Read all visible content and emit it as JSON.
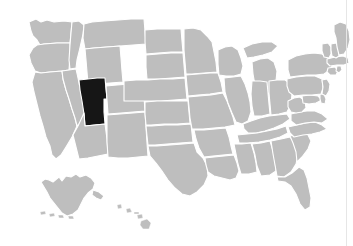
{
  "figure": {
    "type": "choropleth-map",
    "region": "United States",
    "background_color": "#ffffff",
    "width": 353,
    "height": 246,
    "edge_rule": {
      "name": "right-edge-rule",
      "color": "#e6e6e6",
      "x": 346
    }
  },
  "legend": {
    "default_fill": "#bebebe",
    "highlight_fill": "#161616",
    "border_color": "#ffffff",
    "water_color": "#ffffff"
  },
  "chart_data": {
    "type": "map",
    "title": "",
    "subtitle": "",
    "xlabel": "",
    "ylabel": "",
    "legend_position": "none",
    "grid": false,
    "projection": "albers-usa",
    "highlighted_regions": [
      "Utah"
    ],
    "categories": [
      "Washington",
      "Oregon",
      "California",
      "Nevada",
      "Idaho",
      "Montana",
      "Wyoming",
      "Utah",
      "Arizona",
      "New Mexico",
      "Colorado",
      "North Dakota",
      "South Dakota",
      "Nebraska",
      "Kansas",
      "Oklahoma",
      "Texas",
      "Minnesota",
      "Iowa",
      "Missouri",
      "Arkansas",
      "Louisiana",
      "Wisconsin",
      "Illinois",
      "Michigan",
      "Indiana",
      "Ohio",
      "Kentucky",
      "Tennessee",
      "Mississippi",
      "Alabama",
      "Georgia",
      "Florida",
      "South Carolina",
      "North Carolina",
      "Virginia",
      "West Virginia",
      "Maryland",
      "Delaware",
      "Pennsylvania",
      "New Jersey",
      "New York",
      "Connecticut",
      "Rhode Island",
      "Massachusetts",
      "Vermont",
      "New Hampshire",
      "Maine",
      "Alaska",
      "Hawaii"
    ],
    "values": [
      0,
      0,
      0,
      0,
      0,
      0,
      0,
      1,
      0,
      0,
      0,
      0,
      0,
      0,
      0,
      0,
      0,
      0,
      0,
      0,
      0,
      0,
      0,
      0,
      0,
      0,
      0,
      0,
      0,
      0,
      0,
      0,
      0,
      0,
      0,
      0,
      0,
      0,
      0,
      0,
      0,
      0,
      0,
      0,
      0,
      0,
      0,
      0,
      0,
      0
    ],
    "value_labels": {
      "0": "not selected",
      "1": "selected"
    }
  },
  "insets": [
    {
      "name": "alaska-inset",
      "label": "Alaska"
    },
    {
      "name": "hawaii-inset",
      "label": "Hawaii"
    }
  ]
}
